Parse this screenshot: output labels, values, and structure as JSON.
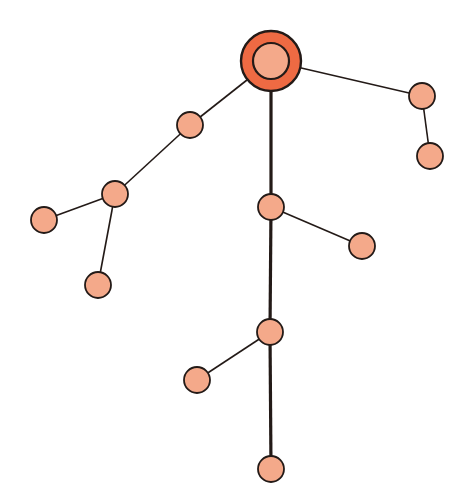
{
  "diagram": {
    "type": "tree",
    "width": 462,
    "height": 502,
    "colors": {
      "background": "#ffffff",
      "root_outer": "#ee6a43",
      "node_fill": "#f4a98a",
      "stroke": "#231a17",
      "edge": "#231a17"
    },
    "root": {
      "id": "root",
      "x": 271,
      "y": 61,
      "r_outer": 30,
      "r_inner": 18
    },
    "nodes": [
      {
        "id": "n1",
        "x": 190,
        "y": 125,
        "r": 13
      },
      {
        "id": "n2",
        "x": 115,
        "y": 194,
        "r": 13
      },
      {
        "id": "n3",
        "x": 44,
        "y": 220,
        "r": 13
      },
      {
        "id": "n4",
        "x": 98,
        "y": 285,
        "r": 13
      },
      {
        "id": "n5",
        "x": 422,
        "y": 96,
        "r": 13
      },
      {
        "id": "n6",
        "x": 430,
        "y": 156,
        "r": 13
      },
      {
        "id": "n7",
        "x": 271,
        "y": 207,
        "r": 13
      },
      {
        "id": "n8",
        "x": 362,
        "y": 246,
        "r": 13
      },
      {
        "id": "n9",
        "x": 270,
        "y": 332,
        "r": 13
      },
      {
        "id": "n10",
        "x": 197,
        "y": 380,
        "r": 13
      },
      {
        "id": "n11",
        "x": 271,
        "y": 469,
        "r": 13
      }
    ],
    "edges": [
      {
        "from": "root",
        "to": "n1",
        "width": 1.6
      },
      {
        "from": "n1",
        "to": "n2",
        "width": 1.6
      },
      {
        "from": "n2",
        "to": "n3",
        "width": 1.6
      },
      {
        "from": "n2",
        "to": "n4",
        "width": 1.6
      },
      {
        "from": "root",
        "to": "n5",
        "width": 1.6
      },
      {
        "from": "n5",
        "to": "n6",
        "width": 1.6
      },
      {
        "from": "root",
        "to": "n7",
        "width": 3.2
      },
      {
        "from": "n7",
        "to": "n8",
        "width": 1.6
      },
      {
        "from": "n7",
        "to": "n9",
        "width": 3.2
      },
      {
        "from": "n9",
        "to": "n10",
        "width": 1.6
      },
      {
        "from": "n9",
        "to": "n11",
        "width": 3.2
      }
    ]
  }
}
